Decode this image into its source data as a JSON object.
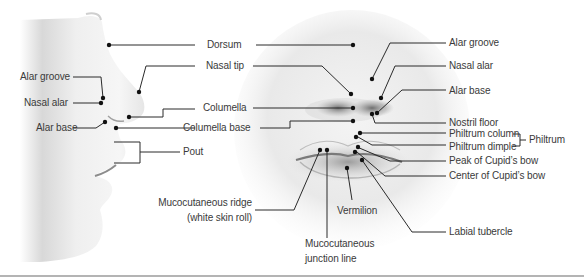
{
  "figure": {
    "profile_view": {
      "labels": {
        "alar_groove": "Alar groove",
        "nasal_alar": "Nasal alar",
        "alar_base": "Alar base"
      }
    },
    "center_labels": {
      "dorsum": "Dorsum",
      "nasal_tip": "Nasal tip",
      "columella": "Columella",
      "columella_base": "Columella base",
      "pout": "Pout",
      "mucocutaneous_ridge_line1": "Mucocutaneous ridge",
      "mucocutaneous_ridge_line2": "(white skin roll)",
      "mucocutaneous_junction_line1": "Mucocutaneous",
      "mucocutaneous_junction_line2": "junction line",
      "vermilion": "Vermilion"
    },
    "frontal_view": {
      "labels": {
        "alar_groove": "Alar groove",
        "nasal_alar": "Nasal alar",
        "alar_base": "Alar base",
        "nostril_floor": "Nostril floor",
        "philtrum_column": "Philtrum column",
        "philtrum_dimple": "Philtrum dimple",
        "philtrum_group": "Philtrum",
        "peak_cupids_bow": "Peak of Cupid’s bow",
        "center_cupids_bow": "Center of Cupid’s bow",
        "labial_tubercle": "Labial tubercle"
      }
    },
    "colors": {
      "label_text": "#3a3a3a",
      "leader_line": "#2a2a2a",
      "dot": "#111111",
      "skin_light": "#f2f2f2",
      "skin_shadow": "#8a8a8a",
      "bottom_rule": "#b4b4b4"
    }
  }
}
